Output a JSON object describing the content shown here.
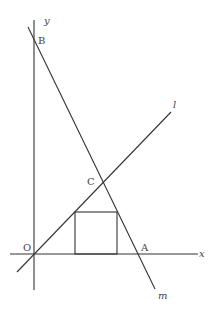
{
  "diagram": {
    "type": "coordinate-geometry",
    "axes": {
      "x_label": "x",
      "y_label": "y",
      "origin_label": "O"
    },
    "lines": [
      {
        "name": "l",
        "label": "l",
        "description": "line through origin O and point C, positive slope"
      },
      {
        "name": "m",
        "label": "m",
        "description": "line through B on y-axis, C, and A on x-axis, negative slope"
      }
    ],
    "points": [
      {
        "label": "O",
        "description": "origin"
      },
      {
        "label": "A",
        "description": "intersection of line m with x-axis"
      },
      {
        "label": "B",
        "description": "intersection of line m with y-axis"
      },
      {
        "label": "C",
        "description": "intersection of lines l and m"
      }
    ],
    "shapes": [
      {
        "type": "square",
        "description": "square with base on x-axis, top-left vertex on line l, top-right vertex on line m"
      }
    ]
  }
}
